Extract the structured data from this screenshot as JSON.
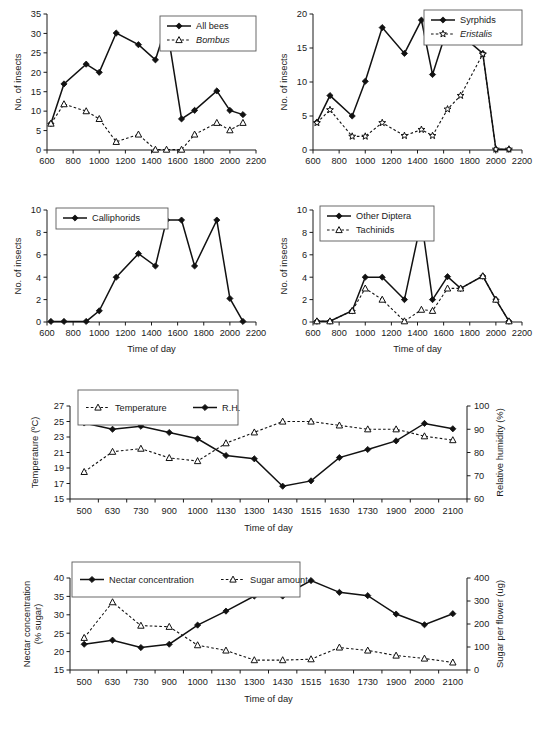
{
  "figure": {
    "caption": "",
    "axis_titles": {
      "insects_y": "No. of insects",
      "time_x": "Time of day",
      "temperature_y": "Temperature (ºC)",
      "humidity_y": "Relative humidity (%)",
      "nectar_y_line1": "Nectar concentration",
      "nectar_y_line2": "(% sugar)",
      "sugar_y": "Sugar per flower (ug)"
    }
  },
  "chart_data": [
    {
      "id": "bees",
      "type": "line",
      "title": "",
      "xlabel": "",
      "ylabel": "No. of insects",
      "xlim": [
        600,
        2200
      ],
      "ylim": [
        0,
        35
      ],
      "xticks": [
        600,
        800,
        1000,
        1200,
        1400,
        1600,
        1800,
        2000,
        2200
      ],
      "yticks": [
        0,
        5,
        10,
        15,
        20,
        25,
        30,
        35
      ],
      "grid": false,
      "legend_position": "top-right",
      "x": [
        630,
        730,
        900,
        1000,
        1130,
        1300,
        1430,
        1515,
        1630,
        1730,
        1900,
        2000,
        2100
      ],
      "series": [
        {
          "name": "All bees",
          "style": "solid",
          "marker": "diamond",
          "italic": false,
          "values": [
            6.8,
            17,
            22.1,
            20,
            30.1,
            27.1,
            23.2,
            32.2,
            8,
            10.2,
            15.2,
            10.2,
            9.1
          ]
        },
        {
          "name": "Bombus",
          "style": "dashed",
          "marker": "triangle",
          "italic": true,
          "values": [
            6.8,
            11.8,
            10,
            8,
            2.1,
            4,
            0.1,
            0.1,
            0.1,
            4,
            7,
            5.1,
            7
          ]
        }
      ]
    },
    {
      "id": "syrphids",
      "type": "line",
      "title": "",
      "xlabel": "",
      "ylabel": "No. of insects",
      "xlim": [
        600,
        2200
      ],
      "ylim": [
        0,
        20
      ],
      "xticks": [
        600,
        800,
        1000,
        1200,
        1400,
        1600,
        1800,
        2000,
        2200
      ],
      "yticks": [
        0,
        5,
        10,
        15,
        20
      ],
      "grid": false,
      "legend_position": "top-right",
      "x": [
        630,
        730,
        900,
        1000,
        1130,
        1300,
        1430,
        1515,
        1630,
        1730,
        1900,
        2000,
        2100
      ],
      "series": [
        {
          "name": "Syrphids",
          "style": "solid",
          "marker": "diamond",
          "italic": false,
          "values": [
            4.1,
            8,
            5,
            10.1,
            18,
            14.2,
            19.1,
            11.1,
            18,
            17,
            14.2,
            0.1,
            0.1
          ]
        },
        {
          "name": "Eristalis",
          "style": "dashed",
          "marker": "star",
          "italic": true,
          "values": [
            4,
            5.9,
            2,
            2,
            4,
            2.1,
            3,
            2.1,
            6,
            8,
            14.1,
            0.1,
            0.1
          ]
        }
      ]
    },
    {
      "id": "calliphorids",
      "type": "line",
      "title": "",
      "xlabel": "Time of day",
      "ylabel": "No. of insects",
      "xlim": [
        600,
        2200
      ],
      "ylim": [
        0,
        10
      ],
      "xticks": [
        600,
        800,
        1000,
        1200,
        1400,
        1600,
        1800,
        2000,
        2200
      ],
      "yticks": [
        0,
        2,
        4,
        6,
        8,
        10
      ],
      "grid": false,
      "legend_position": "top-left",
      "x": [
        630,
        730,
        900,
        1000,
        1130,
        1300,
        1430,
        1515,
        1630,
        1730,
        1900,
        2000,
        2100
      ],
      "series": [
        {
          "name": "Calliphorids",
          "style": "solid",
          "marker": "diamond",
          "italic": false,
          "values": [
            0.05,
            0.05,
            0.05,
            1,
            4,
            6.1,
            5,
            9.1,
            9.1,
            5,
            9.1,
            2.1,
            0.05
          ]
        }
      ]
    },
    {
      "id": "other-diptera",
      "type": "line",
      "title": "",
      "xlabel": "Time of day",
      "ylabel": "No. of insects",
      "xlim": [
        600,
        2200
      ],
      "ylim": [
        0,
        10
      ],
      "xticks": [
        600,
        800,
        1000,
        1200,
        1400,
        1600,
        1800,
        2000,
        2200
      ],
      "yticks": [
        0,
        2,
        4,
        6,
        8,
        10
      ],
      "grid": false,
      "legend_position": "top-left",
      "x": [
        630,
        730,
        900,
        1000,
        1130,
        1300,
        1430,
        1515,
        1630,
        1730,
        1900,
        2000,
        2100
      ],
      "series": [
        {
          "name": "Other Diptera",
          "style": "solid",
          "marker": "diamond",
          "italic": false,
          "values": [
            0.07,
            0.07,
            1,
            4,
            4,
            2,
            9.1,
            2,
            4.05,
            3,
            4.1,
            2,
            0.07
          ]
        },
        {
          "name": "Tachinids",
          "style": "dashed",
          "marker": "triangle",
          "italic": false,
          "values": [
            0.07,
            0.07,
            1,
            3,
            2,
            0.07,
            1.1,
            1,
            3,
            3,
            4.1,
            2,
            0.07
          ]
        }
      ]
    },
    {
      "id": "temp-rh",
      "type": "line",
      "title": "",
      "xlabel": "Time of day",
      "ylabel": "Temperature (ºC)",
      "y2label": "Relative humidity (%)",
      "categories": [
        "500",
        "630",
        "730",
        "900",
        "1000",
        "1130",
        "1300",
        "1430",
        "1515",
        "1630",
        "1730",
        "1900",
        "2000",
        "2100"
      ],
      "ylim": [
        15,
        27
      ],
      "yticks": [
        15,
        17,
        19,
        21,
        23,
        25,
        27
      ],
      "y2lim": [
        60,
        100
      ],
      "y2ticks": [
        60,
        70,
        80,
        90,
        100
      ],
      "grid": false,
      "legend_position": "top-left",
      "series": [
        {
          "name": "Temperature",
          "style": "dashed",
          "marker": "triangle",
          "axis": "left",
          "values": [
            18.5,
            21.1,
            21.5,
            20.3,
            19.9,
            22.2,
            23.6,
            25.0,
            25.0,
            24.5,
            24.0,
            24.0,
            23.1,
            22.6
          ]
        },
        {
          "name": "R.H.",
          "style": "solid",
          "marker": "diamond",
          "axis": "right",
          "values": [
            92.7,
            90.0,
            91.3,
            88.6,
            85.9,
            78.7,
            77.3,
            65.5,
            67.8,
            77.8,
            81.3,
            85.0,
            92.5,
            90.2
          ]
        }
      ]
    },
    {
      "id": "nectar-sugar",
      "type": "line",
      "title": "",
      "xlabel": "Time of day",
      "ylabel": "Nectar concentration (% sugar)",
      "y2label": "Sugar per flower (ug)",
      "categories": [
        "500",
        "630",
        "730",
        "900",
        "1000",
        "1130",
        "1300",
        "1430",
        "1515",
        "1630",
        "1730",
        "1900",
        "2000",
        "2100"
      ],
      "ylim": [
        15,
        40
      ],
      "yticks": [
        15,
        20,
        25,
        30,
        35,
        40
      ],
      "y2lim": [
        0,
        400
      ],
      "y2ticks": [
        0,
        100,
        200,
        300,
        400
      ],
      "grid": false,
      "legend_position": "top-left",
      "series": [
        {
          "name": "Nectar concentration",
          "style": "solid",
          "marker": "diamond",
          "axis": "left",
          "values": [
            22.0,
            23.1,
            21.1,
            22.0,
            27.2,
            31.0,
            35.1,
            35.1,
            39.3,
            36.1,
            35.2,
            30.2,
            27.3,
            30.3
          ]
        },
        {
          "name": "Sugar amount",
          "style": "dashed",
          "marker": "triangle",
          "axis": "right",
          "values": [
            140,
            295,
            193,
            188,
            108,
            85,
            43,
            43,
            47,
            98,
            85,
            63,
            50,
            33
          ]
        }
      ]
    }
  ]
}
